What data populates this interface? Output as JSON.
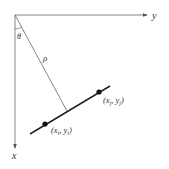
{
  "diagram": {
    "axes": {
      "horizontal_label": "y",
      "vertical_label": "x"
    },
    "angle_label": "θ",
    "distance_label": "ρ",
    "points": [
      {
        "label_var1": "x",
        "label_sub1": "i",
        "label_var2": "y",
        "label_sub2": "i"
      },
      {
        "label_var1": "x",
        "label_sub1": "j",
        "label_var2": "y",
        "label_sub2": "j"
      }
    ],
    "colors": {
      "line": "#333333",
      "axis": "#666666",
      "background": "#ffffff"
    }
  }
}
